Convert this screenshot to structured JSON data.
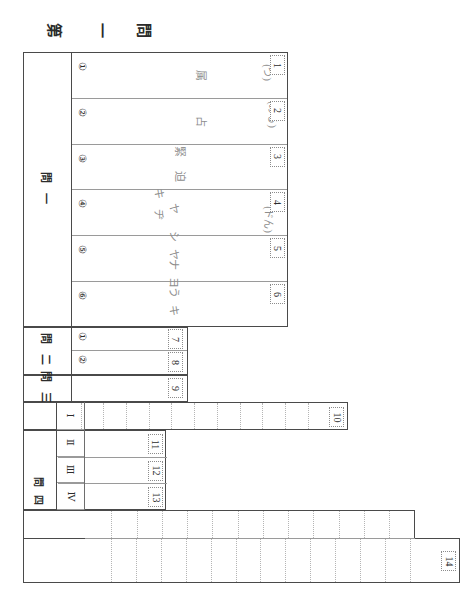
{
  "sheet": {
    "title_chars": [
      "第",
      "一",
      "問"
    ],
    "title_text": "第 一 問"
  },
  "section1": {
    "label": "問 一",
    "items": [
      {
        "marker": "①",
        "box": "1",
        "answer": "属",
        "reading": "(つ)"
      },
      {
        "marker": "②",
        "box": "2",
        "answer": "占",
        "reading": "(める)"
      },
      {
        "marker": "③",
        "box": "3",
        "answer": "緊 迫",
        "reading": ""
      },
      {
        "marker": "④",
        "box": "4",
        "answer": "キ ヂ",
        "reading": "(ドん)"
      },
      {
        "marker": "⑤",
        "box": "5",
        "answer": "ヤ シ ナ う",
        "reading": ""
      },
      {
        "marker": "⑥",
        "box": "6",
        "answer": "ヤ ヨ キ ヨ",
        "reading": ""
      }
    ]
  },
  "section2": {
    "label": "問 二",
    "items": [
      {
        "marker": "①",
        "box": "7"
      },
      {
        "marker": "②",
        "box": "8"
      }
    ]
  },
  "section3": {
    "label": "問 三",
    "items": [
      {
        "marker": "",
        "box": "9"
      }
    ]
  },
  "section4": {
    "label": "問 四",
    "rows": [
      {
        "marker": "Ⅰ",
        "box": "10",
        "cells": 11
      },
      {
        "marker": "Ⅱ",
        "box": "11",
        "cells": 0
      },
      {
        "marker": "Ⅲ",
        "box": "12",
        "cells": 0
      },
      {
        "marker": "Ⅳ",
        "box": "13",
        "cells": 0
      }
    ]
  },
  "section5": {
    "marker": "五",
    "hatched": true,
    "rows": [
      {
        "cells": 12,
        "box": ""
      },
      {
        "cells": 13,
        "box": "14"
      }
    ]
  },
  "colors": {
    "frame": "#4a4a4a",
    "inner_rule": "#9a9a9a",
    "dotted": "#b5b5b5",
    "text": "#2b2b2b",
    "faint_text": "#8d8d8d"
  }
}
